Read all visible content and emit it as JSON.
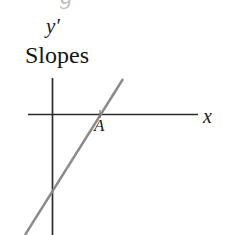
{
  "figure": {
    "caption": "Slopes",
    "background_color": "#ffffff",
    "width": 228,
    "height": 235,
    "axis_color": "#2b2b2b",
    "line_color": "#8a8a8a",
    "text_color": "#1a1a1a",
    "clipped_top_glyph": "g"
  },
  "labels": {
    "y_axis": "y′",
    "x_axis": "x",
    "point_a": "A",
    "caption": "Slopes"
  },
  "chart_data": {
    "type": "line",
    "title": "Slopes",
    "xlabel": "x",
    "ylabel": "y′",
    "grid": false,
    "legend": "none",
    "axes": {
      "x_axis": {
        "label": "x",
        "orientation": "horizontal",
        "pixel_y": 114,
        "pixel_x_start": 28,
        "pixel_x_end": 198
      },
      "y_axis": {
        "label": "y′",
        "orientation": "vertical",
        "pixel_x": 52,
        "pixel_y_start": 78,
        "pixel_y_end": 235
      },
      "origin_pixel": [
        52,
        114
      ]
    },
    "series": [
      {
        "name": "slope-line",
        "type": "line",
        "color": "#8a8a8a",
        "points_pixel": [
          [
            25,
            235
          ],
          [
            123,
            79
          ]
        ],
        "description": "Straight line of positive slope rising left-to-right, crossing the x-axis at point A"
      }
    ],
    "annotations": [
      {
        "label": "A",
        "pixel": [
          100,
          114
        ],
        "description": "Marked intersection of the slope line with the x-axis (x-intercept)"
      }
    ]
  }
}
